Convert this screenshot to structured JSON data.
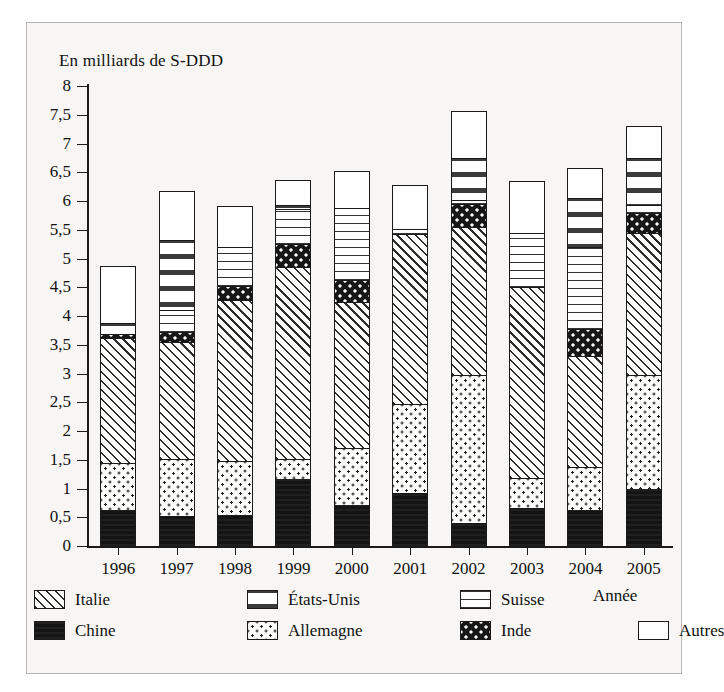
{
  "page": {
    "cut_title": "",
    "axis_unit_caption": "En milliards de S-DDD",
    "x_axis_name": "Année"
  },
  "legend": {
    "row1": [
      {
        "key": "italie",
        "label": "Italie",
        "pattern": "diagonal-hatch"
      },
      {
        "key": "etatsunis",
        "label": "États-Unis",
        "pattern": "sparse-dashes"
      },
      {
        "key": "suisse",
        "label": "Suisse",
        "pattern": "horizontal-lines"
      }
    ],
    "row2": [
      {
        "key": "chine",
        "label": "Chine",
        "pattern": "solid-black"
      },
      {
        "key": "allemagne",
        "label": "Allemagne",
        "pattern": "light-dots"
      },
      {
        "key": "inde",
        "label": "Inde",
        "pattern": "black-with-white-dots"
      },
      {
        "key": "autres",
        "label": "Autres",
        "pattern": "white"
      }
    ]
  },
  "chart_data": {
    "type": "bar",
    "subtype": "stacked-vertical",
    "title": "",
    "xlabel": "Année",
    "ylabel": "En milliards de S-DDD",
    "ylim": [
      0,
      8
    ],
    "ytick_step": 0.5,
    "grid": false,
    "legend_position": "bottom",
    "categories": [
      "1996",
      "1997",
      "1998",
      "1999",
      "2000",
      "2001",
      "2002",
      "2003",
      "2004",
      "2005"
    ],
    "ytick_labels": [
      "0",
      "0,5",
      "1",
      "1,5",
      "2",
      "2,5",
      "3",
      "3,5",
      "4",
      "4,5",
      "5",
      "5,5",
      "6",
      "6,5",
      "7",
      "7,5",
      "8"
    ],
    "stack_order": [
      "chine",
      "allemagne",
      "italie",
      "inde",
      "suisse",
      "etatsunis",
      "autres"
    ],
    "series": [
      {
        "name": "Chine",
        "key": "chine",
        "values": [
          0.63,
          0.53,
          0.54,
          1.17,
          0.72,
          0.92,
          0.4,
          0.66,
          0.62,
          1.0
        ]
      },
      {
        "name": "Allemagne",
        "key": "allemagne",
        "values": [
          0.81,
          0.99,
          0.93,
          0.35,
          0.98,
          1.55,
          2.57,
          0.52,
          0.76,
          1.97
        ]
      },
      {
        "name": "Italie",
        "key": "italie",
        "values": [
          2.17,
          2.03,
          2.8,
          3.33,
          2.55,
          2.96,
          2.58,
          3.32,
          1.92,
          2.48
        ]
      },
      {
        "name": "Inde",
        "key": "inde",
        "values": [
          0.07,
          0.18,
          0.25,
          0.4,
          0.37,
          0.0,
          0.4,
          0.0,
          0.48,
          0.35
        ]
      },
      {
        "name": "Suisse",
        "key": "suisse",
        "values": [
          0.0,
          0.37,
          0.68,
          0.61,
          1.26,
          0.09,
          0.07,
          0.95,
          1.42,
          0.13
        ]
      },
      {
        "name": "États-Unis",
        "key": "etatsunis",
        "values": [
          0.19,
          1.23,
          0.0,
          0.07,
          0.0,
          0.0,
          0.73,
          0.0,
          0.86,
          0.82
        ]
      },
      {
        "name": "Autres",
        "key": "autres",
        "values": [
          1.0,
          0.84,
          0.72,
          0.44,
          0.65,
          0.76,
          0.82,
          0.9,
          0.52,
          0.55
        ]
      }
    ],
    "totals": [
      4.87,
      6.17,
      5.92,
      6.37,
      6.53,
      6.28,
      7.57,
      6.35,
      6.58,
      7.3
    ],
    "cumulative_tops": {
      "1996": {
        "chine": 0.63,
        "allemagne": 1.44,
        "italie": 3.61,
        "inde": 3.68,
        "suisse": 3.68,
        "etatsunis": 3.87,
        "autres": 4.87
      },
      "1997": {
        "chine": 0.53,
        "allemagne": 1.52,
        "italie": 3.55,
        "inde": 3.73,
        "suisse": 4.1,
        "etatsunis": 5.33,
        "autres": 6.17
      },
      "1998": {
        "chine": 0.54,
        "allemagne": 1.47,
        "italie": 4.27,
        "inde": 4.52,
        "suisse": 5.2,
        "etatsunis": 5.2,
        "autres": 5.92
      },
      "1999": {
        "chine": 1.17,
        "allemagne": 1.52,
        "italie": 4.85,
        "inde": 5.25,
        "suisse": 5.86,
        "etatsunis": 5.93,
        "autres": 6.37
      },
      "2000": {
        "chine": 0.72,
        "allemagne": 1.7,
        "italie": 4.25,
        "inde": 4.62,
        "suisse": 5.88,
        "etatsunis": 5.88,
        "autres": 6.53
      },
      "2001": {
        "chine": 0.92,
        "allemagne": 2.47,
        "italie": 5.43,
        "inde": 5.43,
        "suisse": 5.52,
        "etatsunis": 5.52,
        "autres": 6.28
      },
      "2002": {
        "chine": 0.4,
        "allemagne": 2.97,
        "italie": 5.55,
        "inde": 5.95,
        "suisse": 6.02,
        "etatsunis": 6.75,
        "autres": 7.57
      },
      "2003": {
        "chine": 0.66,
        "allemagne": 1.18,
        "italie": 4.5,
        "inde": 4.5,
        "suisse": 5.45,
        "etatsunis": 5.45,
        "autres": 6.35
      },
      "2004": {
        "chine": 0.62,
        "allemagne": 1.38,
        "italie": 3.3,
        "inde": 3.78,
        "suisse": 5.2,
        "etatsunis": 6.06,
        "autres": 6.58
      },
      "2005": {
        "chine": 1.0,
        "allemagne": 2.97,
        "italie": 5.45,
        "inde": 5.8,
        "suisse": 5.93,
        "etatsunis": 6.75,
        "autres": 7.3
      }
    }
  }
}
